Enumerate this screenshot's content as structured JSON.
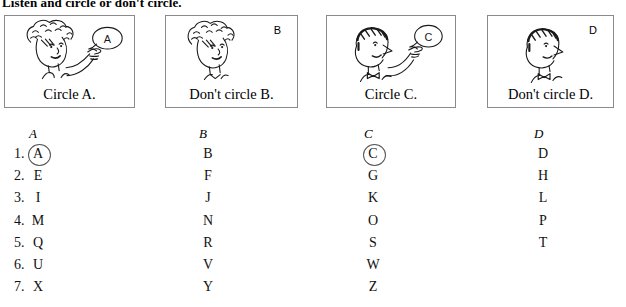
{
  "title": "Listen and circle or don't circle.",
  "picture_boxes": [
    {
      "caption": "Circle A.",
      "letter": "A",
      "letter_in_bubble": true,
      "pointing": true,
      "character": "curly-haired-woman"
    },
    {
      "caption": "Don't circle B.",
      "letter": "B",
      "letter_in_bubble": false,
      "pointing": false,
      "character": "curly-haired-woman"
    },
    {
      "caption": "Circle C.",
      "letter": "C",
      "letter_in_bubble": true,
      "pointing": true,
      "character": "man-with-bow-tie"
    },
    {
      "caption": "Don't circle D.",
      "letter": "D",
      "letter_in_bubble": false,
      "pointing": false,
      "character": "man-with-bow-tie"
    }
  ],
  "grid": {
    "column_headers": [
      "A",
      "B",
      "C",
      "D"
    ],
    "row_numbers": [
      "1.",
      "2.",
      "3.",
      "4.",
      "5.",
      "6.",
      "7."
    ],
    "rows": [
      {
        "number": "1.",
        "cells": [
          "A",
          "B",
          "C",
          "D"
        ],
        "circled": [
          "A",
          "C"
        ]
      },
      {
        "number": "2.",
        "cells": [
          "E",
          "F",
          "G",
          "H"
        ],
        "circled": []
      },
      {
        "number": "3.",
        "cells": [
          "I",
          "J",
          "K",
          "L"
        ],
        "circled": []
      },
      {
        "number": "4.",
        "cells": [
          "M",
          "N",
          "O",
          "P"
        ],
        "circled": []
      },
      {
        "number": "5.",
        "cells": [
          "Q",
          "R",
          "S",
          "T"
        ],
        "circled": []
      },
      {
        "number": "6.",
        "cells": [
          "U",
          "V",
          "W"
        ],
        "circled": []
      },
      {
        "number": "7.",
        "cells": [
          "X",
          "Y",
          "Z"
        ],
        "circled": []
      }
    ]
  },
  "colors": {
    "ink": "#111111",
    "box_border": "#8a8a8a",
    "circle_mark": "#555555",
    "page_background": "#ffffff"
  }
}
